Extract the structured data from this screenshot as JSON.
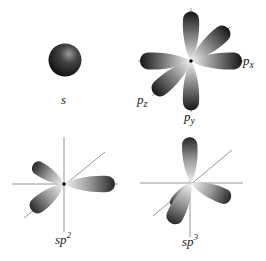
{
  "figure": {
    "panels": [
      {
        "id": "s",
        "label": "s",
        "sub": "",
        "sup": ""
      },
      {
        "id": "p",
        "label": "",
        "axes_labels": {
          "px": {
            "base": "p",
            "sub": "x"
          },
          "py": {
            "base": "p",
            "sub": "y"
          },
          "pz": {
            "base": "p",
            "sub": "z"
          }
        }
      },
      {
        "id": "sp2",
        "label": "sp",
        "sup": "2"
      },
      {
        "id": "sp3",
        "label": "sp",
        "sup": "3"
      }
    ]
  },
  "colors": {
    "lobe_dark": "#1a1a1a",
    "lobe_light": "#e8e8e8",
    "axis": "#8a8a8a",
    "text": "#222222"
  }
}
